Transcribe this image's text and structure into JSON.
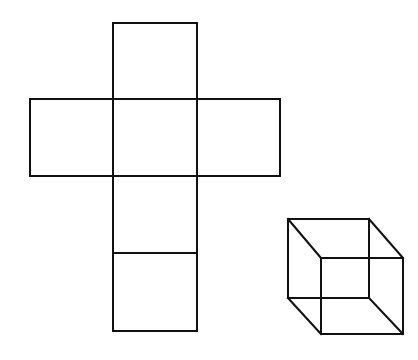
{
  "figure": {
    "stroke_color": "#111111",
    "background": "#ffffff",
    "net": {
      "squares": [
        {
          "name": "top",
          "x": 113,
          "y": 23,
          "w": 84,
          "h": 76
        },
        {
          "name": "left",
          "x": 30,
          "y": 99,
          "w": 83,
          "h": 77
        },
        {
          "name": "center",
          "x": 113,
          "y": 99,
          "w": 84,
          "h": 77
        },
        {
          "name": "right",
          "x": 197,
          "y": 99,
          "w": 83,
          "h": 77
        },
        {
          "name": "lower-middle",
          "x": 113,
          "y": 176,
          "w": 84,
          "h": 77
        },
        {
          "name": "bottom",
          "x": 113,
          "y": 253,
          "w": 84,
          "h": 78
        }
      ]
    },
    "cube": {
      "back_face": {
        "x1": 288,
        "y1": 219,
        "x2": 369,
        "y2": 298
      },
      "front_face": {
        "x1": 321,
        "y1": 258,
        "x2": 403,
        "y2": 334
      }
    }
  }
}
